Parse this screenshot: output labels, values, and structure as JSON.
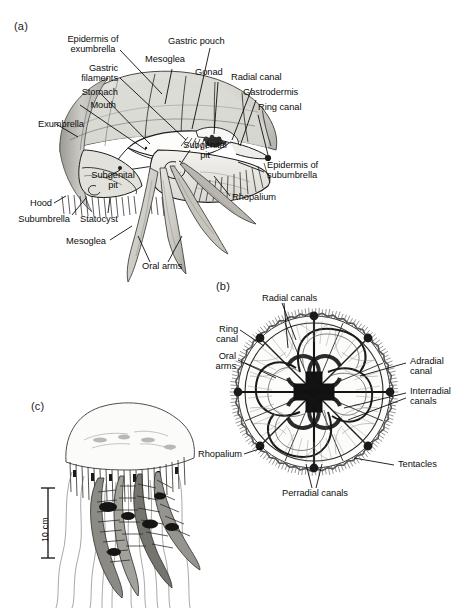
{
  "figure": {
    "panels": [
      {
        "tag": "(a)",
        "caption": "Cutaway lateral view of medusa"
      },
      {
        "tag": "(b)",
        "caption": "Oral (subumbrellar) view showing canal system"
      },
      {
        "tag": "(c)",
        "caption": "Whole live medusa with scale bar"
      }
    ]
  },
  "panel_a": {
    "tag": "(a)",
    "labels": [
      {
        "id": "epidermis-of-exumbrella",
        "text": "Epidermis of\nexumbrella"
      },
      {
        "id": "gastric-filaments",
        "text": "Gastric\nfilaments"
      },
      {
        "id": "stomach",
        "text": "Stomach"
      },
      {
        "id": "mouth",
        "text": "Mouth"
      },
      {
        "id": "exumbrella",
        "text": "Exumbrella"
      },
      {
        "id": "mesoglea-top",
        "text": "Mesoglea"
      },
      {
        "id": "gastric-pouch",
        "text": "Gastric pouch"
      },
      {
        "id": "gonad",
        "text": "Gonad"
      },
      {
        "id": "radial-canal",
        "text": "Radial canal"
      },
      {
        "id": "gastrodermis",
        "text": "Gastrodermis"
      },
      {
        "id": "ring-canal",
        "text": "Ring canal"
      },
      {
        "id": "subgenital-pit-right",
        "text": "Subgenital\npit"
      },
      {
        "id": "subgenital-pit-left",
        "text": "Subgenital\npit"
      },
      {
        "id": "epidermis-of-subumbrella",
        "text": "Epidermis of\nsubumbrella"
      },
      {
        "id": "rhopalium",
        "text": "Rhopalium"
      },
      {
        "id": "hood",
        "text": "Hood"
      },
      {
        "id": "subumbrella",
        "text": "Subumbrella"
      },
      {
        "id": "statocyst",
        "text": "Statocyst"
      },
      {
        "id": "mesoglea-bottom",
        "text": "Mesoglea"
      },
      {
        "id": "oral-arms",
        "text": "Oral arms"
      }
    ]
  },
  "panel_b": {
    "tag": "(b)",
    "labels": [
      {
        "id": "radial-canals",
        "text": "Radial canals"
      },
      {
        "id": "ring-canal",
        "text": "Ring\ncanal"
      },
      {
        "id": "oral-arms",
        "text": "Oral\narms"
      },
      {
        "id": "adradial-canal",
        "text": "Adradial\ncanal"
      },
      {
        "id": "interradial-canals",
        "text": "Interradial\ncanals"
      },
      {
        "id": "tentacles",
        "text": "Tentacles"
      },
      {
        "id": "rhopalium",
        "text": "Rhopalium"
      },
      {
        "id": "perradial-canals",
        "text": "Perradial canals"
      }
    ],
    "structure": {
      "rhopalia_count": 8,
      "perradial_canals": 4,
      "interradial_canals": 4,
      "adradial_canals": 8
    }
  },
  "panel_c": {
    "tag": "(c)",
    "scale_bar": {
      "label": "10 cm"
    }
  },
  "colors": {
    "ink": "#1a1a1a",
    "mesoglea_fill": "#d3d2cd",
    "mesoglea_rim": "#a9a8a2",
    "tissue_fill": "#efeeea",
    "tissue_shade": "#bfbdb6",
    "gonad_dark": "#2b2b2b",
    "background": "#ffffff"
  }
}
